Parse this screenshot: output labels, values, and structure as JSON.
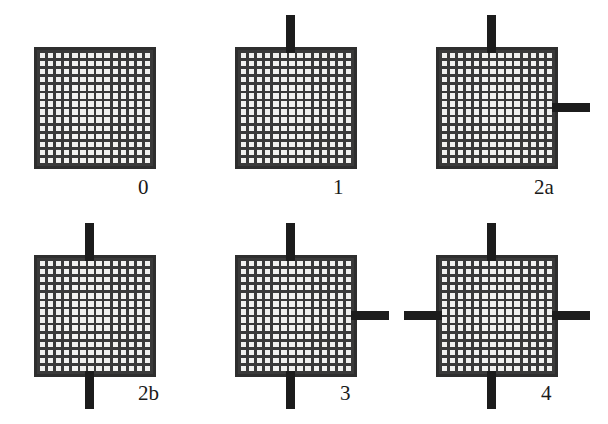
{
  "figure": {
    "type": "diagram",
    "background_color": "#ffffff",
    "mesh_color": "#3a3a3a",
    "mesh_fill_color": "#f2f2f0",
    "border_color": "#2e2e2e",
    "stub_color": "#1c1c1c",
    "grid_cells_per_side": 15,
    "panels": [
      {
        "label": "0",
        "stub_count": 0,
        "stubs": {
          "top": false,
          "right": false,
          "bottom": false,
          "left": false
        },
        "square": {
          "x": 34,
          "y": 47,
          "w": 122,
          "h": 122
        },
        "label_pos": {
          "x": 138,
          "y": 177
        }
      },
      {
        "label": "1",
        "stub_count": 1,
        "stubs": {
          "top": true,
          "right": false,
          "bottom": false,
          "left": false
        },
        "square": {
          "x": 235,
          "y": 47,
          "w": 122,
          "h": 122
        },
        "label_pos": {
          "x": 333,
          "y": 177
        }
      },
      {
        "label": "2a",
        "stub_count": 2,
        "stubs": {
          "top": true,
          "right": true,
          "bottom": false,
          "left": false
        },
        "square": {
          "x": 436,
          "y": 47,
          "w": 122,
          "h": 122
        },
        "label_pos": {
          "x": 534,
          "y": 177
        }
      },
      {
        "label": "2b",
        "stub_count": 2,
        "stubs": {
          "top": true,
          "right": false,
          "bottom": true,
          "left": false
        },
        "square": {
          "x": 34,
          "y": 255,
          "w": 122,
          "h": 122
        },
        "label_pos": {
          "x": 138,
          "y": 383
        }
      },
      {
        "label": "3",
        "stub_count": 3,
        "stubs": {
          "top": true,
          "right": true,
          "bottom": true,
          "left": false
        },
        "square": {
          "x": 235,
          "y": 255,
          "w": 122,
          "h": 122
        },
        "label_pos": {
          "x": 340,
          "y": 383
        }
      },
      {
        "label": "4",
        "stub_count": 4,
        "stubs": {
          "top": true,
          "right": true,
          "bottom": true,
          "left": true
        },
        "square": {
          "x": 436,
          "y": 255,
          "w": 122,
          "h": 122
        },
        "label_pos": {
          "x": 541,
          "y": 383
        }
      }
    ],
    "stub_geometry": {
      "vertical_length": 32,
      "horizontal_length": 32,
      "thickness": 9,
      "top_offset_ratio": 0.42,
      "side_offset_ratio": 0.46
    }
  }
}
